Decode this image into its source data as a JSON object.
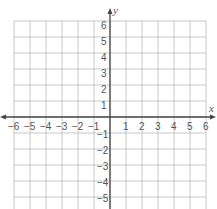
{
  "graph": {
    "x_axis_label": "x",
    "y_axis_label": "y",
    "x_min": -6,
    "x_max": 6,
    "y_min": -6,
    "y_max": 6,
    "x_tick_labels": [
      "−6",
      "−5",
      "−4",
      "−3",
      "−2",
      "−1",
      "1",
      "2",
      "3",
      "4",
      "5",
      "6"
    ],
    "y_tick_labels_positive": [
      "6",
      "5",
      "4",
      "3",
      "2",
      "1"
    ],
    "y_tick_labels_negative": [
      "−1",
      "−2",
      "−3",
      "−4",
      "−5",
      "−6"
    ],
    "colors": {
      "grid": "#b9b9b9",
      "axis": "#444444",
      "text": "#555555"
    }
  }
}
